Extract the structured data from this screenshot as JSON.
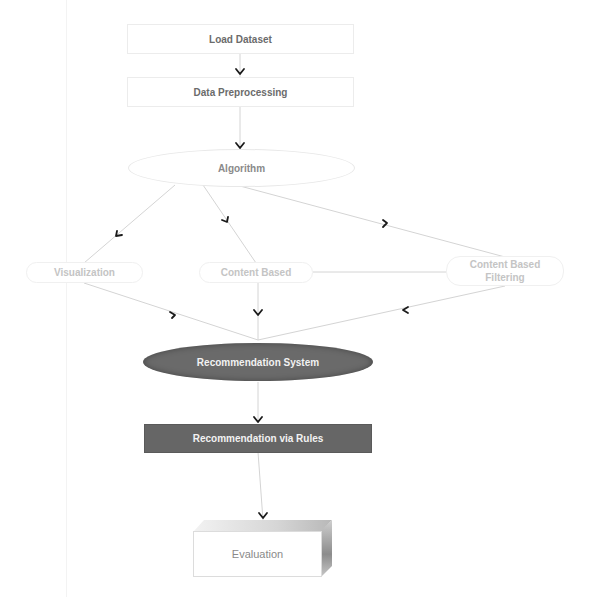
{
  "diagram": {
    "type": "flowchart",
    "nodes": [
      {
        "id": "load",
        "label": "Load Dataset",
        "shape": "rectangle",
        "style": "light"
      },
      {
        "id": "prep",
        "label": "Data Preprocessing",
        "shape": "rectangle",
        "style": "light"
      },
      {
        "id": "algo",
        "label": "Algorithm",
        "shape": "ellipse",
        "style": "light"
      },
      {
        "id": "viz",
        "label": "Visualization",
        "shape": "rounded-rectangle",
        "style": "faint"
      },
      {
        "id": "cb",
        "label": "Content Based",
        "shape": "rounded-rectangle",
        "style": "faint"
      },
      {
        "id": "cbf",
        "label": "Content Based Filtering",
        "shape": "rounded-rectangle",
        "style": "faint"
      },
      {
        "id": "recsys",
        "label": "Recommendation System",
        "shape": "ellipse",
        "style": "dark"
      },
      {
        "id": "rules",
        "label": "Recommendation via Rules",
        "shape": "rectangle",
        "style": "dark"
      },
      {
        "id": "eval",
        "label": "Evaluation",
        "shape": "3d-box",
        "style": "light"
      }
    ],
    "edges": [
      {
        "from": "load",
        "to": "prep"
      },
      {
        "from": "prep",
        "to": "algo"
      },
      {
        "from": "algo",
        "to": "viz"
      },
      {
        "from": "algo",
        "to": "cb"
      },
      {
        "from": "algo",
        "to": "cbf"
      },
      {
        "from": "cb",
        "to": "cbf",
        "arrow": false
      },
      {
        "from": "viz",
        "to": "recsys"
      },
      {
        "from": "cb",
        "to": "recsys"
      },
      {
        "from": "cbf",
        "to": "recsys"
      },
      {
        "from": "recsys",
        "to": "rules"
      },
      {
        "from": "rules",
        "to": "eval"
      }
    ]
  },
  "labels": {
    "load": "Load Dataset",
    "prep": "Data Preprocessing",
    "algo": "Algorithm",
    "viz": "Visualization",
    "cb": "Content Based",
    "cbf_line1": "Content Based",
    "cbf_line2": "Filtering",
    "recsys": "Recommendation System",
    "rules": "Recommendation via Rules",
    "eval": "Evaluation"
  },
  "colors": {
    "edge": "#d0d0d0",
    "arrowhead": "#1a1a1a",
    "dark_fill": "#666666",
    "light_text": "#6b6b6b",
    "faint_text": "#c4c4c4"
  }
}
